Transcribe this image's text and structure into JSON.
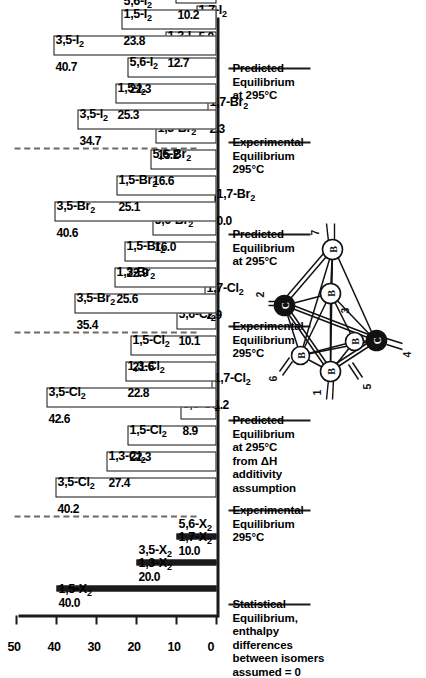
{
  "figure": {
    "axis": {
      "label": "",
      "ticks": [
        "0",
        "10",
        "20",
        "30",
        "40",
        "50"
      ],
      "min": 0,
      "max": 50
    }
  },
  "columns": [
    {
      "id": "statistical",
      "caption": "Statistical\nEquilibrium,\nenthalpy differences\nbetween isomers\nassumed = 0",
      "style": "line",
      "bars": [
        {
          "value": 40.0,
          "value_label": "40.0",
          "labels": [
            "1,5-X₂"
          ]
        },
        {
          "value": 20.0,
          "value_label": "20.0",
          "labels": [
            "1,3-X₂",
            "3,5-X₂"
          ]
        },
        {
          "value": 10.0,
          "value_label": "10.0",
          "labels": [
            "1,7-X₂",
            "5,6-X₂"
          ]
        }
      ]
    },
    {
      "id": "experimental-cl2",
      "caption": "Experimental\nEquilibrium\n295°C",
      "style": "box",
      "bars": [
        {
          "value": 40.2,
          "value_label": "40.2",
          "labels": [
            "3,5-Cl₂"
          ]
        },
        {
          "value": 27.4,
          "value_label": "27.4",
          "labels": [
            "1,3-Cl₂"
          ]
        },
        {
          "value": 22.3,
          "value_label": "22.3",
          "labels": [
            "1,5-Cl₂"
          ]
        },
        {
          "value": 8.9,
          "value_label": "8.9",
          "labels": [
            "5,6-Cl₂"
          ]
        },
        {
          "value": 1.2,
          "value_label": "1.2",
          "labels": [
            "1,7-Cl₂"
          ]
        }
      ]
    },
    {
      "id": "predicted-cl2",
      "caption": "Predicted\nEquilibrium\nat 295°C\nfrom ΔH additivity\nassumption",
      "style": "box",
      "bars": [
        {
          "value": 42.6,
          "value_label": "42.6",
          "labels": [
            "3,5-Cl₂"
          ]
        },
        {
          "value": 22.8,
          "value_label": "22.8",
          "labels": [
            "1,3-Cl₂"
          ]
        },
        {
          "value": 21.6,
          "value_label": "21.6",
          "labels": [
            "1,5-Cl₂"
          ]
        },
        {
          "value": 10.1,
          "value_label": "10.1",
          "labels": [
            "5,6-Cl₂"
          ]
        },
        {
          "value": 2.9,
          "value_label": "2.9",
          "labels": [
            "1,7-Cl₂"
          ]
        }
      ]
    },
    {
      "id": "experimental-br2",
      "caption": "Experimental\nEquilibrium\n295°C",
      "style": "box",
      "bars": [
        {
          "value": 35.4,
          "value_label": "35.4",
          "labels": [
            "3,5-Br₂"
          ]
        },
        {
          "value": 25.6,
          "value_label": "25.6",
          "labels": [
            "1,3-Br₂"
          ]
        },
        {
          "value": 22.9,
          "value_label": "22.9",
          "labels": [
            "1,5-Br₂"
          ]
        },
        {
          "value": 16.0,
          "value_label": "16.0",
          "labels": [
            "5,6-Br₂"
          ]
        },
        {
          "value": 0.0,
          "value_label": "0.0",
          "labels": [
            "1,7-Br₂"
          ]
        }
      ]
    },
    {
      "id": "predicted-br2",
      "caption": "Predicted\nEquilibrium\nat 295°C",
      "style": "box",
      "bars": [
        {
          "value": 40.6,
          "value_label": "40.6",
          "labels": [
            "3,5-Br₂"
          ]
        },
        {
          "value": 25.1,
          "value_label": "25.1",
          "labels": [
            "1,5-Br₂"
          ]
        },
        {
          "value": 16.6,
          "value_label": "16.6",
          "labels": [
            "5,6-Br₂"
          ]
        },
        {
          "value": 15.2,
          "value_label": "15.2",
          "labels": [
            "1,3-Br₂"
          ]
        },
        {
          "value": 2.3,
          "value_label": "2.3",
          "labels": [
            "1,7-Br₂"
          ]
        }
      ]
    },
    {
      "id": "experimental-i2",
      "caption": "Experimental\nEquilibrium\n295°C",
      "style": "box",
      "bars": [
        {
          "value": 34.7,
          "value_label": "34.7",
          "labels": [
            "3,5-I₂"
          ]
        },
        {
          "value": 25.3,
          "value_label": "25.3",
          "labels": [
            "1,5-I₂"
          ]
        },
        {
          "value": 22.3,
          "value_label": "22.3",
          "labels": [
            "5,6-I₂"
          ]
        },
        {
          "value": 12.7,
          "value_label": "12.7",
          "labels": [
            "1,3-I₂"
          ]
        },
        {
          "value": 5.0,
          "value_label": "5.0",
          "labels": [
            "1,7-I₂"
          ]
        }
      ]
    },
    {
      "id": "predicted-i2",
      "caption": "Predicted\nEquilibrium\nat 295°C",
      "style": "box",
      "bars": [
        {
          "value": 40.7,
          "value_label": "40.7",
          "labels": [
            "3,5-I₂"
          ]
        },
        {
          "value": 23.8,
          "value_label": "23.8",
          "labels": [
            "1,5-I₂",
            "5,6-I₂"
          ]
        },
        {
          "value": 10.2,
          "value_label": "10.2",
          "labels": [
            "1,3-I₂"
          ]
        },
        {
          "value": 1.5,
          "value_label": "1.5",
          "labels": [
            "1,7-I₂"
          ]
        }
      ]
    }
  ],
  "molecule": {
    "name": "carborane-cluster-diagram",
    "vertices": [
      {
        "id": "1",
        "element": "B",
        "type": "boron"
      },
      {
        "id": "2",
        "element": "C",
        "type": "carbon"
      },
      {
        "id": "3",
        "element": "B",
        "type": "boron"
      },
      {
        "id": "4",
        "element": "C",
        "type": "carbon"
      },
      {
        "id": "5",
        "element": "B",
        "type": "boron"
      },
      {
        "id": "6",
        "element": "B",
        "type": "boron"
      },
      {
        "id": "7",
        "element": "B",
        "type": "boron"
      }
    ]
  },
  "chart_data": {
    "type": "bar",
    "xlabel": "",
    "ylabel": "",
    "ylim": [
      0,
      50
    ],
    "yticks": [
      0,
      10,
      20,
      30,
      40,
      50
    ],
    "grid": false,
    "legend": "none",
    "orientation": "vertical",
    "groups": [
      {
        "name": "Statistical Equilibrium, enthalpy differences between isomers assumed = 0",
        "categories": [
          "1,5-X₂",
          "1,3-X₂ / 3,5-X₂",
          "1,7-X₂ / 5,6-X₂"
        ],
        "values": [
          40.0,
          20.0,
          10.0
        ]
      },
      {
        "name": "Experimental Equilibrium 295°C (Cl₂)",
        "categories": [
          "3,5-Cl₂",
          "1,3-Cl₂",
          "1,5-Cl₂",
          "5,6-Cl₂",
          "1,7-Cl₂"
        ],
        "values": [
          40.2,
          27.4,
          22.3,
          8.9,
          1.2
        ]
      },
      {
        "name": "Predicted Equilibrium at 295°C from ΔH additivity assumption (Cl₂)",
        "categories": [
          "3,5-Cl₂",
          "1,3-Cl₂",
          "1,5-Cl₂",
          "5,6-Cl₂",
          "1,7-Cl₂"
        ],
        "values": [
          42.6,
          22.8,
          21.6,
          10.1,
          2.9
        ]
      },
      {
        "name": "Experimental Equilibrium 295°C (Br₂)",
        "categories": [
          "3,5-Br₂",
          "1,3-Br₂",
          "1,5-Br₂",
          "5,6-Br₂",
          "1,7-Br₂"
        ],
        "values": [
          35.4,
          25.6,
          22.9,
          16.0,
          0.0
        ]
      },
      {
        "name": "Predicted Equilibrium at 295°C (Br₂)",
        "categories": [
          "3,5-Br₂",
          "1,5-Br₂",
          "5,6-Br₂",
          "1,3-Br₂",
          "1,7-Br₂"
        ],
        "values": [
          40.6,
          25.1,
          16.6,
          15.2,
          2.3
        ]
      },
      {
        "name": "Experimental Equilibrium 295°C (I₂)",
        "categories": [
          "3,5-I₂",
          "1,5-I₂",
          "5,6-I₂",
          "1,3-I₂",
          "1,7-I₂"
        ],
        "values": [
          34.7,
          25.3,
          22.3,
          12.7,
          5.0
        ]
      },
      {
        "name": "Predicted Equilibrium at 295°C (I₂)",
        "categories": [
          "3,5-I₂",
          "1,5-I₂ / 5,6-I₂",
          "1,3-I₂",
          "1,7-I₂"
        ],
        "values": [
          40.7,
          23.8,
          10.2,
          1.5
        ]
      }
    ]
  }
}
